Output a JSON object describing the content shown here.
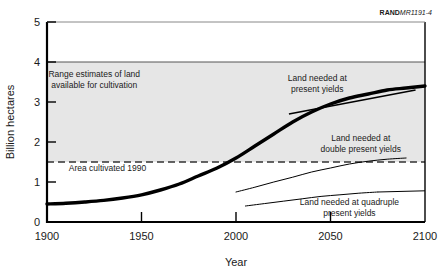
{
  "credit": {
    "brand": "RAND",
    "code": "MR1191-4"
  },
  "chart_data": {
    "type": "line",
    "title": "",
    "subtitle": "",
    "xlabel": "Year",
    "ylabel": "Billion hectares",
    "xlim": [
      1900,
      2100
    ],
    "ylim": [
      0,
      5
    ],
    "xticks": [
      1900,
      1950,
      2000,
      2050,
      2100
    ],
    "xticklabels": [
      "1900",
      "1950",
      "2000",
      "2050",
      "2100"
    ],
    "yticks": [
      0,
      1,
      2,
      3,
      4,
      5
    ],
    "yticklabels": [
      "0",
      "1",
      "2",
      "3",
      "4",
      "5"
    ],
    "yminorticks": [
      1.5,
      2,
      3
    ],
    "grid": false,
    "legend": "none",
    "series": [
      {
        "name": "Land needed at present yields",
        "style": "thick-solid",
        "x": [
          1900,
          1910,
          1920,
          1930,
          1940,
          1950,
          1960,
          1970,
          1980,
          1990,
          2000,
          2010,
          2020,
          2030,
          2040,
          2050,
          2060,
          2070,
          2080,
          2090,
          2100
        ],
        "values": [
          0.45,
          0.47,
          0.5,
          0.54,
          0.6,
          0.68,
          0.8,
          0.95,
          1.15,
          1.35,
          1.6,
          1.9,
          2.2,
          2.5,
          2.75,
          2.95,
          3.1,
          3.2,
          3.3,
          3.35,
          3.4
        ]
      },
      {
        "name": "Land needed at double present yields",
        "style": "thin-solid",
        "x": [
          2000,
          2010,
          2020,
          2030,
          2040,
          2050,
          2060,
          2070,
          2080,
          2090
        ],
        "values": [
          0.75,
          0.87,
          1.0,
          1.12,
          1.25,
          1.35,
          1.45,
          1.52,
          1.57,
          1.6
        ]
      },
      {
        "name": "Land needed at quadruple present yields",
        "style": "thin-solid",
        "x": [
          2005,
          2015,
          2025,
          2035,
          2045,
          2055,
          2065,
          2075
        ],
        "values": [
          0.4,
          0.46,
          0.52,
          0.58,
          0.64,
          0.68,
          0.72,
          0.75
        ]
      }
    ],
    "bands": [
      {
        "name": "Range estimates of land available for cultivation",
        "y_from": 1.5,
        "y_to": 4.0,
        "fill": "#e6e6e6"
      }
    ],
    "hlines": [
      {
        "name": "upper range estimate",
        "y": 4.0,
        "style": "solid"
      },
      {
        "name": "Area cultivated 1990",
        "y": 1.5,
        "style": "dashed"
      }
    ],
    "annotations": [
      {
        "name": "range-estimates",
        "lines": [
          "Range estimates of land",
          "available for cultivation"
        ],
        "x": 1925,
        "y": 3.63
      },
      {
        "name": "area-cultivated-1990",
        "lines": [
          "Area cultivated 1990"
        ],
        "x": 1932,
        "y": 1.27
      },
      {
        "name": "present-yields",
        "lines": [
          "Land needed at",
          "present yields"
        ],
        "x": 2043,
        "y": 3.53
      },
      {
        "name": "double-present-yields",
        "lines": [
          "Land needed at",
          "double present yields"
        ],
        "x": 2066,
        "y": 2.02
      },
      {
        "name": "quadruple-present-yields",
        "lines": [
          "Land needed at quadruple",
          "present yields"
        ],
        "x": 2060,
        "y": 0.42
      }
    ],
    "colors": {
      "band": "#e6e6e6",
      "line": "#000000",
      "axis": "#000000",
      "text": "#1a1a1a",
      "background": "#ffffff"
    }
  }
}
